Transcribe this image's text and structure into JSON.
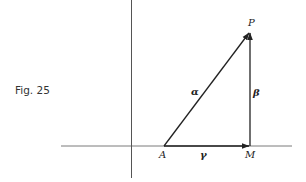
{
  "figure": {
    "caption": "Fig. 25",
    "points": {
      "A": {
        "label": "A",
        "x": 164,
        "y": 146
      },
      "M": {
        "label": "M",
        "x": 250,
        "y": 146
      },
      "P": {
        "label": "P",
        "x": 250,
        "y": 32
      }
    },
    "vectors": [
      {
        "name": "alpha",
        "label": "α",
        "from": "A",
        "to": "P"
      },
      {
        "name": "beta",
        "label": "β",
        "from": "M",
        "to": "P"
      },
      {
        "name": "gamma",
        "label": "γ",
        "from": "A",
        "to": "M"
      }
    ],
    "axes": {
      "horizontal": {
        "x1": 61,
        "x2": 292,
        "y": 146
      },
      "vertical": {
        "x": 131,
        "y1": 0,
        "y2": 178
      }
    },
    "colors": {
      "axis": "#7a7a7a",
      "vector": "#222222"
    }
  }
}
